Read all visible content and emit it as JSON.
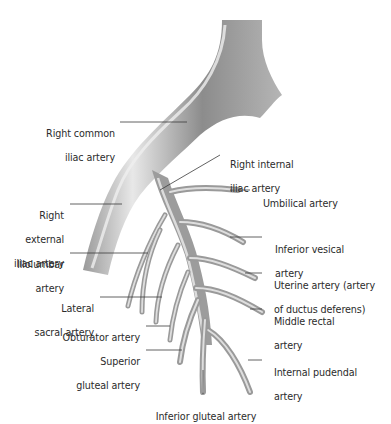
{
  "diagram": {
    "colors": {
      "vessel_dark": "#7a7a7a",
      "vessel_mid": "#a6a6a6",
      "vessel_light": "#e4e4e4",
      "leader_line": "#3a3a3a",
      "text": "#2b2b2b",
      "background": "#ffffff"
    },
    "labels": [
      {
        "id": "right-common-iliac",
        "lines": [
          "Right common",
          "iliac artery"
        ]
      },
      {
        "id": "right-internal-iliac",
        "lines": [
          "Right internal",
          "iliac artery"
        ]
      },
      {
        "id": "umbilical",
        "lines": [
          "Umbilical artery"
        ]
      },
      {
        "id": "right-external-iliac",
        "lines": [
          "Right",
          "external",
          "iliac artery"
        ]
      },
      {
        "id": "inferior-vesical",
        "lines": [
          "Inferior vesical",
          "artery"
        ]
      },
      {
        "id": "iliolumbar",
        "lines": [
          "Iliolumbar",
          "artery"
        ]
      },
      {
        "id": "uterine",
        "lines": [
          "Uterine artery (artery",
          "of ductus deferens)"
        ]
      },
      {
        "id": "lateral-sacral",
        "lines": [
          "Lateral",
          "sacral artery"
        ]
      },
      {
        "id": "middle-rectal",
        "lines": [
          "Middle rectal",
          "artery"
        ]
      },
      {
        "id": "obturator",
        "lines": [
          "Obturator artery"
        ]
      },
      {
        "id": "superior-gluteal",
        "lines": [
          "Superior",
          "gluteal artery"
        ]
      },
      {
        "id": "internal-pudendal",
        "lines": [
          "Internal pudendal",
          "artery"
        ]
      },
      {
        "id": "inferior-gluteal",
        "lines": [
          "Inferior gluteal artery"
        ]
      }
    ]
  }
}
